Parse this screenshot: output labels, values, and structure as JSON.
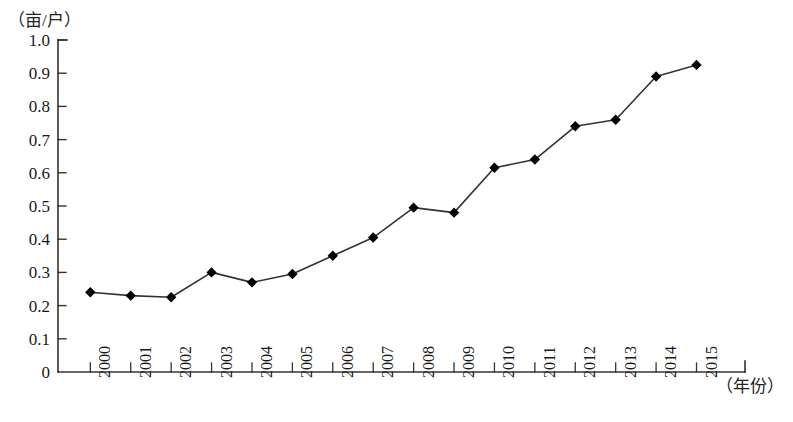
{
  "chart_data": {
    "type": "line",
    "title": "",
    "subtitle": "",
    "xlabel": "（年份）",
    "ylabel": "（亩/户）",
    "categories": [
      "2000",
      "2001",
      "2002",
      "2003",
      "2004",
      "2005",
      "2006",
      "2007",
      "2008",
      "2009",
      "2010",
      "2011",
      "2012",
      "2013",
      "2014",
      "2015"
    ],
    "values": [
      0.24,
      0.23,
      0.225,
      0.3,
      0.27,
      0.295,
      0.35,
      0.405,
      0.495,
      0.48,
      0.615,
      0.64,
      0.74,
      0.76,
      0.89,
      0.925
    ],
    "series": [
      {
        "name": "",
        "values": [
          0.24,
          0.23,
          0.225,
          0.3,
          0.27,
          0.295,
          0.35,
          0.405,
          0.495,
          0.48,
          0.615,
          0.64,
          0.74,
          0.76,
          0.89,
          0.925
        ]
      }
    ],
    "ylim": [
      0,
      1.0
    ],
    "ytick_labels": [
      "0",
      "0.1",
      "0.2",
      "0.3",
      "0.4",
      "0.5",
      "0.6",
      "0.7",
      "0.8",
      "0.9",
      "1.0"
    ],
    "ytick_values": [
      0,
      0.1,
      0.2,
      0.3,
      0.4,
      0.5,
      0.6,
      0.7,
      0.8,
      0.9,
      1.0
    ],
    "grid": false,
    "legend": false,
    "legend_position": "none",
    "marker": "diamond",
    "line_color": "#333333",
    "marker_color": "#000000",
    "axis_color": "#333333",
    "annotations": []
  }
}
